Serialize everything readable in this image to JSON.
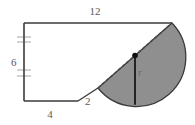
{
  "figure": {
    "colors": {
      "stroke": "#3a3a3a",
      "fill_gray": "#908f8f",
      "label_text": "#5a5a5a",
      "background": "#ffffff",
      "tick_mark": "#b0aeb0"
    },
    "labels": {
      "top": "12",
      "left": "6",
      "bottom": "4",
      "diagonal": "2",
      "radius": "r"
    },
    "geometry": {
      "polygon_points": "24,23 172,23 172,23 98,88 78,101 24,101",
      "outline_path": "M 24 23 L 172 23 M 24 23 L 24 101 M 24 101 L 78 101 M 78 101 L 98 88",
      "semicircle": {
        "diameter_start_x": 98,
        "diameter_start_y": 88,
        "diameter_end_x": 172,
        "diameter_end_y": 23,
        "center_x": 135,
        "center_y": 55.5,
        "radius": 49.3,
        "arc_sweep": "bulges toward lower-right"
      },
      "center_dot": {
        "x": 135,
        "y": 55.5,
        "r": 2.6
      },
      "radius_line": {
        "x1": 135,
        "y1": 55.5,
        "x2": 135,
        "y2": 104.8
      },
      "left_tick_marks": [
        {
          "x1": 17,
          "y1": 37,
          "x2": 31,
          "y2": 37
        },
        {
          "x1": 17,
          "y1": 42,
          "x2": 31,
          "y2": 42
        },
        {
          "x1": 17,
          "y1": 70,
          "x2": 31,
          "y2": 70
        },
        {
          "x1": 17,
          "y1": 76,
          "x2": 31,
          "y2": 76
        }
      ]
    },
    "icons": {
      "center_point": "filled-dot-icon"
    }
  }
}
